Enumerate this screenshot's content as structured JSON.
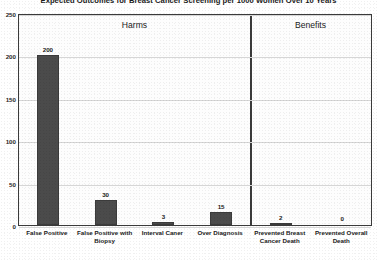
{
  "chart_data": {
    "type": "bar",
    "title": "Expected  Outcomes for Breast Cancer Screening per 1000 Women Over 10 Years",
    "xlabel": "",
    "ylabel": "",
    "ylim": [
      0,
      250
    ],
    "yticks": [
      "0",
      "50",
      "100",
      "150",
      "200",
      "250"
    ],
    "grid": true,
    "legend": "none",
    "panels": [
      {
        "name": "harms",
        "label": "Harms",
        "categories": [
          "False Positive",
          "False Positive with Biopsy",
          "Interval Caner",
          "Over Diagnosis"
        ],
        "values": [
          200,
          30,
          3,
          15
        ]
      },
      {
        "name": "benefits",
        "label": "Benefits",
        "categories": [
          "Prevented Breast Cancer Death",
          "Prevented Overall Death"
        ],
        "values": [
          2,
          0
        ]
      }
    ],
    "categories": [
      "False Positive",
      "False Positive with Biopsy",
      "Interval Caner",
      "Over Diagnosis",
      "Prevented Breast Cancer Death",
      "Prevented Overall Death"
    ],
    "values": [
      200,
      30,
      3,
      15,
      2,
      0
    ],
    "value_labels": [
      "200",
      "30",
      "3",
      "15",
      "2",
      "0"
    ],
    "bar_color": "#4b4b4b",
    "gridline_color": "#d6d6d6",
    "frame_color": "#3a3a3a"
  }
}
